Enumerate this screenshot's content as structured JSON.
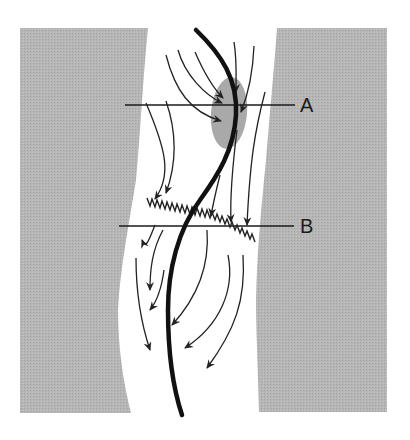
{
  "diagram": {
    "type": "channel-flow-schematic",
    "colors": {
      "background": "#ffffff",
      "bank_fill": "#b4b4b4",
      "bank_pattern_dark": "#a6a6a6",
      "channel_line": "#111111",
      "flow_arrow": "#222222",
      "shaded_zone": "#9c9c9c",
      "section_line": "#1a1a1a"
    },
    "labels": {
      "section_a": "A",
      "section_b": "B"
    },
    "elements": {
      "left_bank": "gray bank (left)",
      "right_bank": "gray bank (right)",
      "thalweg": "thick curved centre line",
      "flow_arrows": "curved flow arrows",
      "zigzag": "zigzag crossing line near B",
      "shaded_zone": "shaded ellipse near A"
    }
  }
}
